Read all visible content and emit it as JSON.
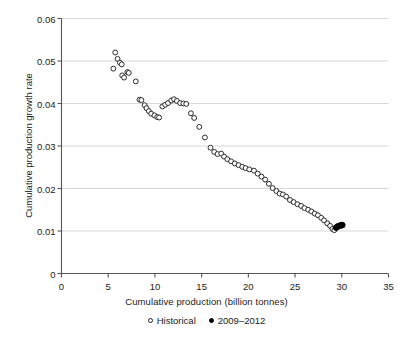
{
  "chart_data": {
    "type": "scatter",
    "title": "",
    "xlabel": "Cumulative production (billion tonnes)",
    "ylabel": "Cumulative production growth rate",
    "xlim": [
      0,
      35
    ],
    "ylim": [
      0,
      0.06
    ],
    "xticks": [
      0,
      5,
      10,
      15,
      20,
      25,
      30,
      35
    ],
    "xticklabels": [
      "0",
      "5",
      "10",
      "15",
      "20",
      "25",
      "30",
      "35"
    ],
    "yticks": [
      0,
      0.01,
      0.02,
      0.03,
      0.04,
      0.05,
      0.06
    ],
    "yticklabels": [
      "0",
      "0.01",
      "0.02",
      "0.03",
      "0.04",
      "0.05",
      "0.06"
    ],
    "grid": "horizontal",
    "grid_color": "#d8d8d8",
    "legend_position": "below-axis-center",
    "series": [
      {
        "name": "Historical",
        "marker": "open-circle",
        "color": "#222222",
        "fill": "#ffffff",
        "points": [
          [
            5.55,
            0.0482
          ],
          [
            5.75,
            0.052
          ],
          [
            6.0,
            0.0505
          ],
          [
            6.25,
            0.0496
          ],
          [
            6.45,
            0.0492
          ],
          [
            6.5,
            0.0466
          ],
          [
            6.7,
            0.0461
          ],
          [
            7.05,
            0.0474
          ],
          [
            7.2,
            0.0472
          ],
          [
            7.95,
            0.0452
          ],
          [
            8.35,
            0.0409
          ],
          [
            8.55,
            0.0408
          ],
          [
            8.9,
            0.0396
          ],
          [
            9.1,
            0.0389
          ],
          [
            9.35,
            0.0382
          ],
          [
            9.6,
            0.0376
          ],
          [
            9.95,
            0.0372
          ],
          [
            10.25,
            0.0368
          ],
          [
            10.45,
            0.0367
          ],
          [
            10.8,
            0.0393
          ],
          [
            11.1,
            0.0397
          ],
          [
            11.4,
            0.0401
          ],
          [
            11.75,
            0.0407
          ],
          [
            12.05,
            0.041
          ],
          [
            12.35,
            0.0406
          ],
          [
            12.7,
            0.0401
          ],
          [
            13.05,
            0.04
          ],
          [
            13.35,
            0.0399
          ],
          [
            13.85,
            0.0377
          ],
          [
            14.2,
            0.0366
          ],
          [
            14.75,
            0.0345
          ],
          [
            15.35,
            0.032
          ],
          [
            15.95,
            0.0296
          ],
          [
            16.35,
            0.0286
          ],
          [
            16.7,
            0.0281
          ],
          [
            17.1,
            0.0282
          ],
          [
            17.4,
            0.0275
          ],
          [
            17.75,
            0.0269
          ],
          [
            18.15,
            0.0264
          ],
          [
            18.55,
            0.0259
          ],
          [
            18.95,
            0.0255
          ],
          [
            19.35,
            0.0251
          ],
          [
            19.7,
            0.0248
          ],
          [
            20.1,
            0.0245
          ],
          [
            20.6,
            0.0242
          ],
          [
            21.0,
            0.0235
          ],
          [
            21.4,
            0.0228
          ],
          [
            21.8,
            0.0221
          ],
          [
            22.2,
            0.0211
          ],
          [
            22.6,
            0.0201
          ],
          [
            23.0,
            0.0194
          ],
          [
            23.35,
            0.0188
          ],
          [
            23.7,
            0.0186
          ],
          [
            24.05,
            0.0181
          ],
          [
            24.45,
            0.0173
          ],
          [
            24.85,
            0.0168
          ],
          [
            25.25,
            0.0163
          ],
          [
            25.65,
            0.0159
          ],
          [
            26.0,
            0.0154
          ],
          [
            26.4,
            0.015
          ],
          [
            26.75,
            0.0146
          ],
          [
            27.1,
            0.0141
          ],
          [
            27.45,
            0.0137
          ],
          [
            27.8,
            0.0131
          ],
          [
            28.1,
            0.0125
          ],
          [
            28.45,
            0.0118
          ],
          [
            28.75,
            0.0112
          ],
          [
            29.0,
            0.0105
          ],
          [
            29.2,
            0.0102
          ]
        ]
      },
      {
        "name": "2009–2012",
        "marker": "filled-circle",
        "color": "#000000",
        "fill": "#000000",
        "points": [
          [
            29.4,
            0.0108
          ],
          [
            29.6,
            0.0111
          ],
          [
            29.85,
            0.0113
          ],
          [
            30.05,
            0.0114
          ]
        ]
      }
    ]
  },
  "legend": {
    "entries": [
      {
        "label": "Historical",
        "marker": "open-circle"
      },
      {
        "label": "2009–2012",
        "marker": "filled-circle"
      }
    ]
  },
  "axes": {
    "x_title": "Cumulative production (billion tonnes)",
    "y_title": "Cumulative production growth rate"
  }
}
